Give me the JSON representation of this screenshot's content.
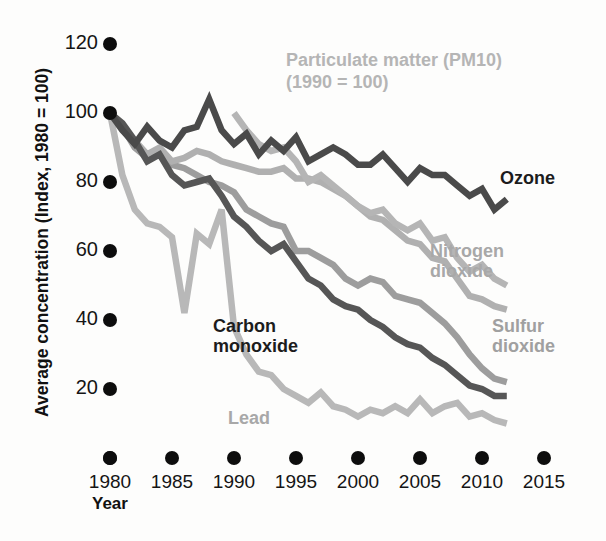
{
  "chart_data": {
    "type": "line",
    "title": "",
    "xlabel": "Year",
    "ylabel": "Average concentration (Index, 1980 = 100)",
    "xlim": [
      1980,
      2015
    ],
    "ylim": [
      0,
      120
    ],
    "grid": false,
    "legend_position": "inline-annotations",
    "x_ticks": [
      "1980",
      "1985",
      "1990",
      "1995",
      "2000",
      "2005",
      "2010",
      "2015"
    ],
    "y_ticks": [
      "20",
      "40",
      "60",
      "80",
      "100",
      "120"
    ],
    "y_tick_values": [
      0,
      20,
      40,
      60,
      80,
      100,
      120
    ],
    "y_tick_unlabeled": [
      0
    ],
    "x": [
      1980,
      1981,
      1982,
      1983,
      1984,
      1985,
      1986,
      1987,
      1988,
      1989,
      1990,
      1991,
      1992,
      1993,
      1994,
      1995,
      1996,
      1997,
      1998,
      1999,
      2000,
      2001,
      2002,
      2003,
      2004,
      2005,
      2006,
      2007,
      2008,
      2009,
      2010,
      2011,
      2012
    ],
    "series": [
      {
        "name": "Ozone",
        "color": "#4a4a4a",
        "label_color": "#1c1c1c",
        "x": [
          1980,
          1981,
          1982,
          1983,
          1984,
          1985,
          1986,
          1987,
          1988,
          1989,
          1990,
          1991,
          1992,
          1993,
          1994,
          1995,
          1996,
          1997,
          1998,
          1999,
          2000,
          2001,
          2002,
          2003,
          2004,
          2005,
          2006,
          2007,
          2008,
          2009,
          2010,
          2011,
          2012
        ],
        "values": [
          100,
          95,
          91,
          96,
          92,
          90,
          95,
          96,
          104,
          95,
          91,
          94,
          88,
          92,
          89,
          93,
          86,
          88,
          90,
          88,
          85,
          85,
          88,
          84,
          80,
          84,
          82,
          82,
          79,
          76,
          78,
          72,
          75
        ]
      },
      {
        "name": "Particulate matter (PM10)",
        "sublabel": "(1990 = 100)",
        "color": "#b5b5b5",
        "label_color": "#b5b5b5",
        "x": [
          1990,
          1991,
          1992,
          1993,
          1994,
          1995,
          1996,
          1997,
          1998,
          1999,
          2000,
          2001,
          2002,
          2003,
          2004,
          2005,
          2006,
          2007,
          2008,
          2009,
          2010,
          2011,
          2012
        ],
        "values": [
          100,
          95,
          91,
          89,
          90,
          86,
          80,
          82,
          79,
          76,
          73,
          71,
          72,
          68,
          66,
          68,
          63,
          64,
          58,
          54,
          56,
          52,
          50
        ]
      },
      {
        "name": "Nitrogen dioxide",
        "color": "#b0b0b0",
        "label_color": "#a8a8a8",
        "x": [
          1980,
          1981,
          1982,
          1983,
          1984,
          1985,
          1986,
          1987,
          1988,
          1989,
          1990,
          1991,
          1992,
          1993,
          1994,
          1995,
          1996,
          1997,
          1998,
          1999,
          2000,
          2001,
          2002,
          2003,
          2004,
          2005,
          2006,
          2007,
          2008,
          2009,
          2010,
          2011,
          2012
        ],
        "values": [
          100,
          95,
          92,
          88,
          90,
          86,
          87,
          89,
          88,
          86,
          85,
          84,
          83,
          83,
          84,
          81,
          81,
          80,
          78,
          76,
          73,
          70,
          69,
          66,
          63,
          62,
          58,
          57,
          52,
          47,
          46,
          44,
          43
        ]
      },
      {
        "name": "Carbon monoxide",
        "color": "#565656",
        "label_color": "#1c1c1c",
        "x": [
          1980,
          1981,
          1982,
          1983,
          1984,
          1985,
          1986,
          1987,
          1988,
          1989,
          1990,
          1991,
          1992,
          1993,
          1994,
          1995,
          1996,
          1997,
          1998,
          1999,
          2000,
          2001,
          2002,
          2003,
          2004,
          2005,
          2006,
          2007,
          2008,
          2009,
          2010,
          2011,
          2012
        ],
        "values": [
          100,
          97,
          92,
          86,
          88,
          82,
          79,
          80,
          81,
          76,
          70,
          67,
          63,
          60,
          62,
          57,
          52,
          50,
          46,
          44,
          43,
          40,
          38,
          35,
          33,
          32,
          29,
          27,
          24,
          21,
          20,
          18,
          18
        ]
      },
      {
        "name": "Sulfur dioxide",
        "color": "#9d9d9d",
        "label_color": "#a0a0a0",
        "x": [
          1980,
          1981,
          1982,
          1983,
          1984,
          1985,
          1986,
          1987,
          1988,
          1989,
          1990,
          1991,
          1992,
          1993,
          1994,
          1995,
          1996,
          1997,
          1998,
          1999,
          2000,
          2001,
          2002,
          2003,
          2004,
          2005,
          2006,
          2007,
          2008,
          2009,
          2010,
          2011,
          2012
        ],
        "values": [
          100,
          96,
          90,
          87,
          89,
          85,
          84,
          82,
          80,
          79,
          77,
          72,
          70,
          68,
          67,
          60,
          60,
          58,
          56,
          52,
          50,
          52,
          51,
          47,
          46,
          45,
          42,
          39,
          35,
          30,
          26,
          23,
          22
        ]
      },
      {
        "name": "Lead",
        "color": "#b8b8b8",
        "label_color": "#a8a8a8",
        "x": [
          1980,
          1981,
          1982,
          1983,
          1984,
          1985,
          1986,
          1987,
          1988,
          1989,
          1990,
          1991,
          1992,
          1993,
          1994,
          1995,
          1996,
          1997,
          1998,
          1999,
          2000,
          2001,
          2002,
          2003,
          2004,
          2005,
          2006,
          2007,
          2008,
          2009,
          2010,
          2011,
          2012
        ],
        "values": [
          100,
          82,
          72,
          68,
          67,
          64,
          42,
          65,
          62,
          72,
          38,
          30,
          25,
          24,
          20,
          18,
          16,
          19,
          15,
          14,
          12,
          14,
          13,
          15,
          13,
          17,
          13,
          15,
          16,
          12,
          13,
          11,
          10
        ]
      }
    ],
    "annotations": [
      {
        "name": "Ozone",
        "x_px": 500,
        "y_px": 170
      },
      {
        "name": "Particulate matter (PM10)",
        "x_px": 286,
        "y_px": 52
      },
      {
        "name": "Nitrogen dioxide",
        "x_px": 430,
        "y_px": 243
      },
      {
        "name": "Sulfur dioxide",
        "x_px": 492,
        "y_px": 318
      },
      {
        "name": "Carbon monoxide",
        "x_px": 213,
        "y_px": 318
      },
      {
        "name": "Lead",
        "x_px": 228,
        "y_px": 410
      }
    ]
  },
  "labels": {
    "ozone": "Ozone",
    "pm10_line1": "Particulate matter (PM10)",
    "pm10_line2": "(1990 = 100)",
    "nitrogen": "Nitrogen\ndioxide",
    "sulfur": "Sulfur\ndioxide",
    "carbon": "Carbon\nmonoxide",
    "lead": "Lead",
    "y_axis_title": "Average concentration (Index, 1980 = 100)",
    "x_axis_title": "Year"
  },
  "colors": {
    "ozone": "#4a4a4a",
    "pm10": "#b5b5b5",
    "nitrogen": "#b0b0b0",
    "carbon": "#565656",
    "sulfur": "#9d9d9d",
    "lead": "#b8b8b8",
    "tick_dot": "#0d0d0d",
    "text": "#151515",
    "background": "#fdfdfc"
  }
}
